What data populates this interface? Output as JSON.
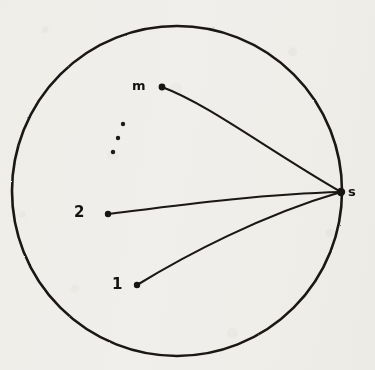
{
  "figure": {
    "kind": "circle-network-diagram",
    "caption": "",
    "ink_color": "#1a1714",
    "paper_color": "#f7f6f4",
    "width": 375,
    "height": 370
  },
  "boundary": {
    "shape": "circle",
    "center_x": 177,
    "center_y": 191,
    "radius": 165,
    "stroke_width": 2.6
  },
  "nodes": [
    {
      "id": "m",
      "label": "m",
      "x": 162,
      "y": 87,
      "label_x": 138,
      "label_y": 86,
      "dot_radius": 3.4
    },
    {
      "id": "2",
      "label": "2",
      "x": 108,
      "y": 214,
      "label_x": 80,
      "label_y": 213,
      "dot_radius": 3.2
    },
    {
      "id": "1",
      "label": "1",
      "x": 137,
      "y": 285,
      "label_x": 118,
      "label_y": 285,
      "dot_radius": 3.2
    },
    {
      "id": "s",
      "label": "s",
      "x": 341,
      "y": 192,
      "label_x": 353,
      "label_y": 192,
      "dot_radius": 4.2
    }
  ],
  "ellipsis": {
    "label": "vertical-ellipsis",
    "dots": [
      {
        "x": 123,
        "y": 124,
        "r": 2.2
      },
      {
        "x": 118,
        "y": 138,
        "r": 2.2
      },
      {
        "x": 113,
        "y": 152,
        "r": 2.2
      }
    ]
  },
  "edges": [
    {
      "id": "edge-m-s",
      "from": "m",
      "to": "s",
      "path": "M 162 87 C 208 104 268 150 341 192"
    },
    {
      "id": "edge-2-s",
      "from": "2",
      "to": "s",
      "path": "M 108 214 C 165 207 258 194 341 192"
    },
    {
      "id": "edge-1-s",
      "from": "1",
      "to": "s",
      "path": "M 137 285 C 186 255 262 215 341 192"
    }
  ]
}
